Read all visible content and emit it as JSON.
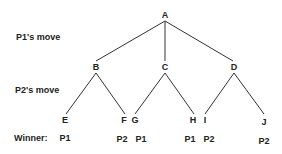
{
  "diagram": {
    "type": "game-tree",
    "row_labels": {
      "p1_move": "P1's move",
      "p2_move": "P2's move",
      "winner": "Winner:"
    },
    "root": "A",
    "level1": [
      "B",
      "C",
      "D"
    ],
    "leaves": [
      "E",
      "F",
      "G",
      "H",
      "I",
      "J"
    ],
    "edges": [
      [
        "A",
        "B"
      ],
      [
        "A",
        "C"
      ],
      [
        "A",
        "D"
      ],
      [
        "B",
        "E"
      ],
      [
        "B",
        "F"
      ],
      [
        "C",
        "G"
      ],
      [
        "C",
        "H"
      ],
      [
        "D",
        "I"
      ],
      [
        "D",
        "J"
      ]
    ],
    "winners": {
      "E": "P1",
      "F": "P2",
      "G": "P1",
      "H": "P1",
      "I": "P2",
      "J": "P2"
    },
    "winner_list": [
      "P1",
      "P2",
      "P1",
      "P1",
      "P2",
      "P2"
    ],
    "line_color": "#333333",
    "text_color": "#222222"
  }
}
